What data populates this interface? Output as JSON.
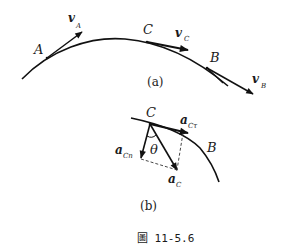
{
  "figure": {
    "caption": "圖 11-5.6",
    "panel_a": {
      "label": "(a)",
      "points": [
        {
          "name": "A"
        },
        {
          "name": "C"
        },
        {
          "name": "B"
        }
      ],
      "vectors": [
        {
          "base": "v",
          "sub": "A"
        },
        {
          "base": "v",
          "sub": "C"
        },
        {
          "base": "v",
          "sub": "B"
        }
      ]
    },
    "panel_b": {
      "label": "(b)",
      "points": [
        {
          "name": "C"
        },
        {
          "name": "B"
        }
      ],
      "vectors": [
        {
          "base": "a",
          "sub": "Cτ"
        },
        {
          "base": "a",
          "sub": "Cn"
        },
        {
          "base": "a",
          "sub": "C"
        }
      ],
      "angle": "θ"
    }
  }
}
